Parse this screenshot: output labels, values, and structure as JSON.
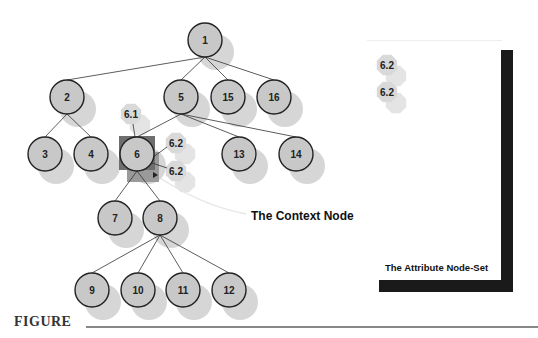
{
  "diagram": {
    "type": "tree",
    "nodes": [
      {
        "id": "1",
        "label": "1",
        "x": 205,
        "y": 40
      },
      {
        "id": "2",
        "label": "2",
        "x": 67,
        "y": 97
      },
      {
        "id": "5",
        "label": "5",
        "x": 181,
        "y": 97
      },
      {
        "id": "15",
        "label": "15",
        "x": 228,
        "y": 97
      },
      {
        "id": "16",
        "label": "16",
        "x": 274,
        "y": 97
      },
      {
        "id": "3",
        "label": "3",
        "x": 45,
        "y": 154
      },
      {
        "id": "4",
        "label": "4",
        "x": 91,
        "y": 154
      },
      {
        "id": "6",
        "label": "6",
        "x": 137,
        "y": 154
      },
      {
        "id": "13",
        "label": "13",
        "x": 239,
        "y": 154
      },
      {
        "id": "14",
        "label": "14",
        "x": 296,
        "y": 154
      },
      {
        "id": "7",
        "label": "7",
        "x": 115,
        "y": 218
      },
      {
        "id": "8",
        "label": "8",
        "x": 160,
        "y": 218
      },
      {
        "id": "9",
        "label": "9",
        "x": 92,
        "y": 290
      },
      {
        "id": "10",
        "label": "10",
        "x": 138,
        "y": 290
      },
      {
        "id": "11",
        "label": "11",
        "x": 183,
        "y": 290
      },
      {
        "id": "12",
        "label": "12",
        "x": 229,
        "y": 290
      }
    ],
    "edges": [
      [
        "1",
        "2"
      ],
      [
        "1",
        "5"
      ],
      [
        "1",
        "15"
      ],
      [
        "1",
        "16"
      ],
      [
        "2",
        "3"
      ],
      [
        "2",
        "4"
      ],
      [
        "5",
        "6"
      ],
      [
        "5",
        "13"
      ],
      [
        "5",
        "14"
      ],
      [
        "6",
        "7"
      ],
      [
        "6",
        "8"
      ],
      [
        "8",
        "9"
      ],
      [
        "8",
        "10"
      ],
      [
        "8",
        "11"
      ],
      [
        "8",
        "12"
      ]
    ],
    "attribute_nodes": [
      {
        "label": "6.1",
        "x": 131,
        "y": 114
      },
      {
        "label": "6.2",
        "x": 176,
        "y": 143
      },
      {
        "label": "6.2",
        "x": 176,
        "y": 171
      }
    ],
    "attribute_set_nodes": [
      {
        "label": "6.2",
        "x": 387,
        "y": 65
      },
      {
        "label": "6.2",
        "x": 387,
        "y": 92
      }
    ],
    "context_node_id": "6",
    "annotations": {
      "context_node": "The Context Node",
      "attribute_node_set": "The Attribute Node-Set"
    },
    "colors": {
      "node_fill": "#c8c8c8",
      "node_stroke": "#222222",
      "shadow": "#d6d6d6",
      "attr_fill": "#d9d9d9",
      "context_box": "#6e6e6e",
      "bar": "#1a1a1a"
    }
  },
  "caption": {
    "label": "FIGURE"
  }
}
